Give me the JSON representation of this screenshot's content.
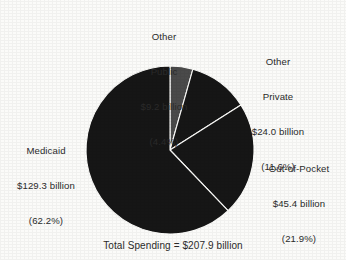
{
  "chart_data": {
    "type": "pie",
    "title": "",
    "caption": "Total Spending = $207.9 billion",
    "total_label": "Total Spending",
    "total_value": "$207.9 billion",
    "units": "billions of dollars",
    "start_angle_deg": 0,
    "direction": "clockwise",
    "legend": "none",
    "labels_position": "outside",
    "categories": [
      "Other Public",
      "Other Private",
      "Out-of-Pocket",
      "Medicaid"
    ],
    "values": [
      9.2,
      24.0,
      45.4,
      129.3
    ],
    "percents": [
      4.4,
      11.6,
      21.9,
      62.2
    ],
    "colors": [
      "#4a4a4a",
      "#161616",
      "#161616",
      "#161616"
    ],
    "slices": [
      {
        "name": "Other Public",
        "name_line1": "Other",
        "name_line2": "Public",
        "value_label": "$9.2 billion",
        "percent_label": "(4.4%)",
        "value": 9.2,
        "percent": 4.4,
        "color": "#4a4a4a"
      },
      {
        "name": "Other Private",
        "name_line1": "Other",
        "name_line2": "Private",
        "value_label": "$24.0 billion",
        "percent_label": "(11.6%)",
        "value": 24.0,
        "percent": 11.6,
        "color": "#161616"
      },
      {
        "name": "Out-of-Pocket",
        "name_line1": "Out-of-Pocket",
        "name_line2": "",
        "value_label": "$45.4 billion",
        "percent_label": "(21.9%)",
        "value": 45.4,
        "percent": 21.9,
        "color": "#161616"
      },
      {
        "name": "Medicaid",
        "name_line1": "Medicaid",
        "name_line2": "",
        "value_label": "$129.3 billion",
        "percent_label": "(62.2%)",
        "value": 129.3,
        "percent": 62.2,
        "color": "#161616"
      }
    ]
  }
}
